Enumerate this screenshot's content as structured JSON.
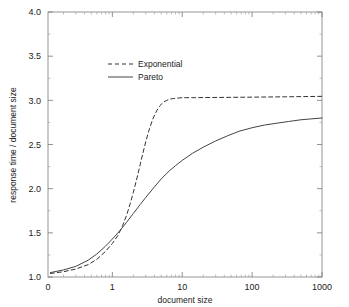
{
  "chart_data": {
    "type": "line",
    "title": "",
    "xlabel": "document size",
    "ylabel": "response time / document size",
    "xscale": "log",
    "yscale": "linear",
    "xlim": [
      0.12,
      1000
    ],
    "ylim": [
      1.0,
      4.0
    ],
    "grid": false,
    "legend_position": "upper-left-inside",
    "x_ticks": [
      "0",
      "1",
      "10",
      "100",
      "1000"
    ],
    "x_tick_values": [
      0.12,
      1,
      10,
      100,
      1000
    ],
    "y_ticks": [
      "1.0",
      "1.5",
      "2.0",
      "2.5",
      "3.0",
      "3.5",
      "4.0"
    ],
    "y_tick_values": [
      1.0,
      1.5,
      2.0,
      2.5,
      3.0,
      3.5,
      4.0
    ],
    "series": [
      {
        "name": "Exponential",
        "style": "dashed",
        "color": "#333333",
        "x": [
          0.13,
          0.2,
          0.3,
          0.45,
          0.6,
          0.8,
          1.0,
          1.2,
          1.4,
          1.6,
          1.8,
          2.0,
          2.3,
          2.6,
          3.0,
          3.4,
          3.8,
          4.3,
          4.8,
          5.4,
          6.0,
          6.8,
          7.5,
          8.5,
          10,
          15,
          25,
          50,
          100,
          300,
          1000
        ],
        "y": [
          1.04,
          1.06,
          1.09,
          1.14,
          1.2,
          1.29,
          1.38,
          1.47,
          1.58,
          1.7,
          1.83,
          1.96,
          2.15,
          2.33,
          2.53,
          2.68,
          2.79,
          2.88,
          2.94,
          2.98,
          3.0,
          3.015,
          3.02,
          3.025,
          3.03,
          3.03,
          3.032,
          3.034,
          3.036,
          3.04,
          3.045
        ]
      },
      {
        "name": "Pareto",
        "style": "solid",
        "color": "#444444",
        "x": [
          0.13,
          0.2,
          0.3,
          0.45,
          0.6,
          0.8,
          1.0,
          1.3,
          1.6,
          2.0,
          2.5,
          3.0,
          4.0,
          5.0,
          6.5,
          8.0,
          10,
          14,
          20,
          30,
          45,
          65,
          100,
          150,
          220,
          330,
          500,
          700,
          1000
        ],
        "y": [
          1.05,
          1.08,
          1.12,
          1.19,
          1.26,
          1.35,
          1.43,
          1.53,
          1.62,
          1.72,
          1.82,
          1.9,
          2.02,
          2.11,
          2.2,
          2.26,
          2.32,
          2.4,
          2.47,
          2.54,
          2.6,
          2.65,
          2.69,
          2.72,
          2.74,
          2.76,
          2.78,
          2.79,
          2.8
        ]
      }
    ]
  },
  "legend": {
    "entries": [
      {
        "label": "Exponential",
        "style": "dashed"
      },
      {
        "label": "Pareto",
        "style": "solid"
      }
    ]
  },
  "axes": {
    "x_title": "document size",
    "y_title": "response time / document size"
  }
}
